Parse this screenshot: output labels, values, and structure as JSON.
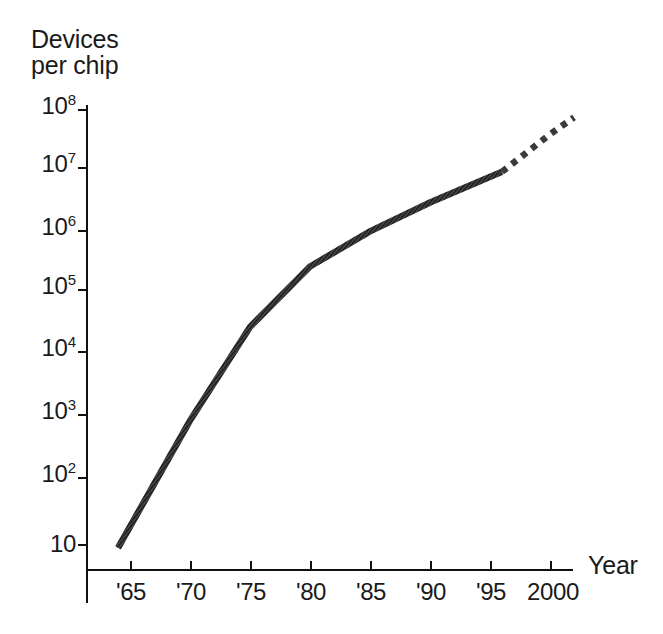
{
  "chart_data": {
    "type": "line",
    "title": "",
    "ylabel_line1": "Devices",
    "ylabel_line2": "per chip",
    "xlabel": "Year",
    "y_scale": "log",
    "ylim": [
      10,
      100000000
    ],
    "xlim": [
      1963,
      2002
    ],
    "grid": false,
    "legend": null,
    "y_ticks": [
      {
        "mantissa": "10",
        "exponent": "8",
        "value": 100000000
      },
      {
        "mantissa": "10",
        "exponent": "7",
        "value": 10000000
      },
      {
        "mantissa": "10",
        "exponent": "6",
        "value": 1000000
      },
      {
        "mantissa": "10",
        "exponent": "5",
        "value": 100000
      },
      {
        "mantissa": "10",
        "exponent": "4",
        "value": 10000
      },
      {
        "mantissa": "10",
        "exponent": "3",
        "value": 1000
      },
      {
        "mantissa": "10",
        "exponent": "2",
        "value": 100
      },
      {
        "mantissa": "10",
        "exponent": "",
        "value": 10
      }
    ],
    "x_ticks": [
      {
        "label": "'65",
        "value": 1965
      },
      {
        "label": "'70",
        "value": 1970
      },
      {
        "label": "'75",
        "value": 1975
      },
      {
        "label": "'80",
        "value": 1980
      },
      {
        "label": "'85",
        "value": 1985
      },
      {
        "label": "'90",
        "value": 1990
      },
      {
        "label": "'95",
        "value": 1995
      },
      {
        "label": "2000",
        "value": 2000
      }
    ],
    "series": [
      {
        "name": "Devices per chip (historical)",
        "style": "solid",
        "color": "#3a3a3a",
        "x": [
          1964,
          1970,
          1975,
          1980,
          1985,
          1990,
          1996
        ],
        "values": [
          9,
          1000,
          32000,
          300000,
          1100000,
          3200000,
          10000000
        ]
      },
      {
        "name": "Devices per chip (projected)",
        "style": "dashed",
        "color": "#3a3a3a",
        "x": [
          1996,
          1998,
          2000,
          2002
        ],
        "values": [
          10000000,
          20000000,
          40000000,
          75000000
        ]
      }
    ]
  },
  "geometry": {
    "plot_left": 86,
    "plot_right": 573,
    "plot_bottom": 570,
    "plot_top": 105,
    "decade_px": 62.2,
    "y_pixels": {
      "1e8": 110,
      "1e7": 168,
      "1e6": 231,
      "1e5": 290,
      "1e4": 352,
      "1e3": 415,
      "1e2": 478,
      "1e1": 545
    },
    "x_pixels": {
      "1965": 130,
      "1970": 190,
      "1975": 250,
      "1980": 310,
      "1985": 370,
      "1990": 430,
      "1995": 490,
      "2000": 550
    },
    "solid_start": [
      112,
      546
    ],
    "solid_end": [
      505,
      181
    ],
    "dashed_start": [
      508,
      178
    ],
    "dashed_end": [
      571,
      118
    ]
  }
}
